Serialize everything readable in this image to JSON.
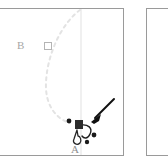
{
  "figure": {
    "background_color": "#ffffff",
    "panels": [
      {
        "id": "panel-a",
        "name": "left-panel",
        "border_color": "#9a9a9a",
        "background_color": "#ffffff"
      },
      {
        "id": "panel-b",
        "name": "right-panel",
        "border_color": "#9a9a9a",
        "background_color": "#ffffff",
        "content": "empty"
      }
    ],
    "labels": {
      "point_b": "B",
      "point_a": "A",
      "label_color": "#a6a6a6"
    },
    "elements": {
      "dashed_arc": {
        "name": "dashed-trajectory-arc",
        "color": "#e2e2e2",
        "style": "dashed",
        "description": "light gray dashed arc bowing left from top to bottom"
      },
      "vertical_line": {
        "name": "vertical-reference-line",
        "color": "#efefef",
        "style": "solid"
      },
      "open_square_marker": {
        "name": "open-square-marker",
        "color": "#b4b4b4",
        "fill": "#ffffff"
      },
      "filled_square_marker": {
        "name": "filled-square-marker",
        "color": "#2b2b2b"
      },
      "pointer_arrow": {
        "name": "pointer-arrow",
        "color": "#101010",
        "direction": "down-left"
      },
      "dots": {
        "name": "dark-dot-marker",
        "color": "#1a1a1a",
        "count": 3
      },
      "hook_curve": {
        "name": "hook-curve-stroke",
        "color": "#1d1d1d"
      }
    }
  }
}
